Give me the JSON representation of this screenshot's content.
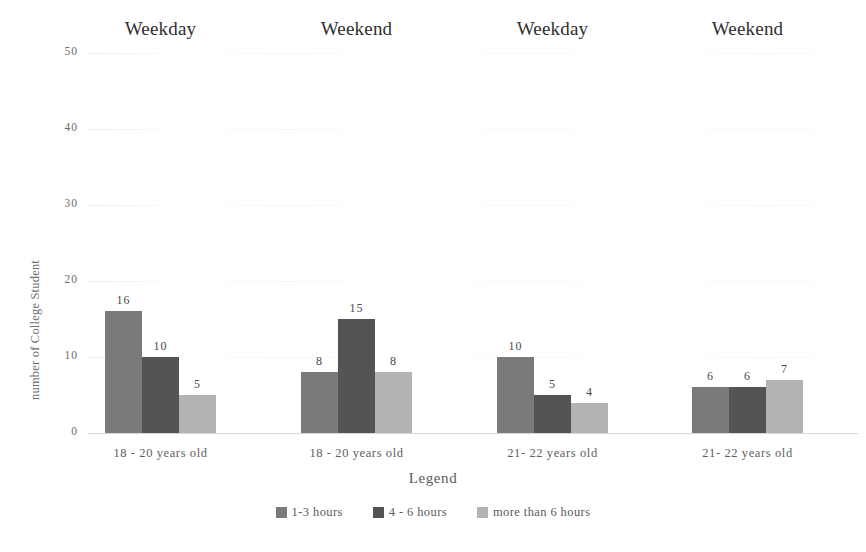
{
  "chart_data": {
    "type": "bar",
    "title": "",
    "xlabel": "Legend",
    "ylabel": "number of College Student",
    "ylim": [
      0,
      50
    ],
    "yticks": [
      0,
      10,
      20,
      30,
      40,
      50
    ],
    "grid": true,
    "legend_position": "bottom",
    "legend_title": "Legend",
    "categories": [
      "18 - 20 years old",
      "18 - 20  years old",
      "21-  22  years old",
      "21-  22  years old"
    ],
    "group_headers": [
      "Weekday",
      "Weekend",
      "Weekday",
      "Weekend"
    ],
    "series": [
      {
        "name": "1-3 hours",
        "color": "#7a7a7a",
        "values": [
          16,
          8,
          10,
          6
        ]
      },
      {
        "name": "4 - 6 hours",
        "color": "#545454",
        "values": [
          10,
          15,
          5,
          6
        ]
      },
      {
        "name": "more than 6 hours",
        "color": "#b3b3b3",
        "values": [
          5,
          8,
          4,
          7
        ]
      }
    ]
  },
  "axis": {
    "y_title": "number of College Student",
    "y_tick_labels": [
      "50",
      "40",
      "30",
      "20",
      "10",
      "0"
    ]
  },
  "headers": [
    {
      "label": "Weekday"
    },
    {
      "label": "Weekend"
    },
    {
      "label": "Weekday"
    },
    {
      "label": "Weekend"
    }
  ],
  "groups": [
    {
      "label": "18 - 20 years old",
      "bars": [
        {
          "value": "16",
          "series": "1-3 hours"
        },
        {
          "value": "10",
          "series": "4 - 6 hours"
        },
        {
          "value": "5",
          "series": "more than 6 hours"
        }
      ]
    },
    {
      "label": "18 - 20  years old",
      "bars": [
        {
          "value": "8",
          "series": "1-3 hours"
        },
        {
          "value": "15",
          "series": "4 - 6 hours"
        },
        {
          "value": "8",
          "series": "more than 6 hours"
        }
      ]
    },
    {
      "label": "21-  22  years old",
      "bars": [
        {
          "value": "10",
          "series": "1-3 hours"
        },
        {
          "value": "5",
          "series": "4 - 6 hours"
        },
        {
          "value": "4",
          "series": "more than 6 hours"
        }
      ]
    },
    {
      "label": "21-  22  years old",
      "bars": [
        {
          "value": "6",
          "series": "1-3 hours"
        },
        {
          "value": "6",
          "series": "4 - 6 hours"
        },
        {
          "value": "7",
          "series": "more than 6 hours"
        }
      ]
    }
  ],
  "legend": {
    "title": "Legend",
    "items": [
      {
        "label": "1-3 hours",
        "color": "#7a7a7a"
      },
      {
        "label": "4 - 6 hours",
        "color": "#545454"
      },
      {
        "label": "more than 6 hours",
        "color": "#b3b3b3"
      }
    ]
  },
  "colors": {
    "series_1_3_hours": "#7a7a7a",
    "series_4_6_hours": "#545454",
    "series_more_than_6_hours": "#b3b3b3",
    "background": "#ffffff",
    "text": "#5a5a5a"
  }
}
